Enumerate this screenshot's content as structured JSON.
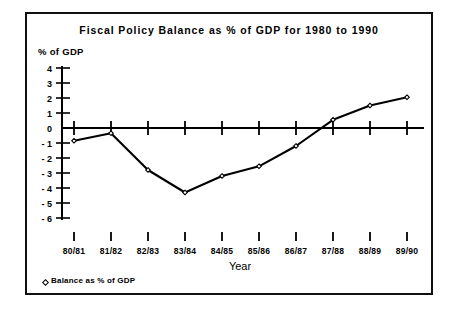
{
  "figure": {
    "title": "Fiscal Policy Balance as % of GDP for 1980 to 1990",
    "y_axis_caption": "% of GDP",
    "x_axis_caption": "Year",
    "legend_label": "Balance as % of GDP",
    "legend_marker": "diamond-open-marker",
    "frame_color": "#111111",
    "line_color": "#000000",
    "background": "#ffffff"
  },
  "chart_data": {
    "type": "line",
    "title": "Fiscal Policy Balance as % of GDP for 1980 to 1990",
    "xlabel": "Year",
    "ylabel": "% of GDP",
    "categories": [
      "80/81",
      "81/82",
      "82/83",
      "83/84",
      "84/85",
      "85/86",
      "86/87",
      "87/88",
      "88/89",
      "89/90"
    ],
    "series": [
      {
        "name": "Balance as % of GDP",
        "values": [
          -0.85,
          -0.35,
          -2.8,
          -4.3,
          -3.2,
          -2.55,
          -1.2,
          0.55,
          1.5,
          2.05
        ]
      }
    ],
    "ylim": [
      -6,
      4
    ],
    "yticks": [
      4,
      3,
      2,
      1,
      0,
      -1,
      -2,
      -3,
      -4,
      -5,
      -6
    ],
    "ytick_labels": [
      "4",
      "3",
      "2",
      "1",
      "0",
      "- 1",
      "- 2",
      "- 3",
      "- 4",
      "- 5",
      "- 6"
    ],
    "grid": false,
    "legend_position": "bottom-left",
    "zero_line": true
  }
}
